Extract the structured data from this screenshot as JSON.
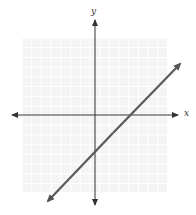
{
  "chart_data": {
    "type": "line",
    "title": "",
    "xlabel": "x",
    "ylabel": "y",
    "grid": true,
    "xlim": [
      -7,
      7
    ],
    "ylim": [
      -8,
      8
    ],
    "series": [
      {
        "name": "line",
        "equation": "y = x - 4",
        "slope": 1,
        "x_intercept": 4,
        "y_intercept": -4,
        "points": [
          [
            -5,
            -9
          ],
          [
            9,
            5
          ]
        ],
        "color": "#555555"
      }
    ]
  },
  "labels": {
    "x_axis": "x",
    "y_axis": "y"
  },
  "colors": {
    "grid": "#e6e6e6",
    "grid_bg": "#f4f4f4",
    "axis": "#333333",
    "line": "#5a5a5a"
  }
}
